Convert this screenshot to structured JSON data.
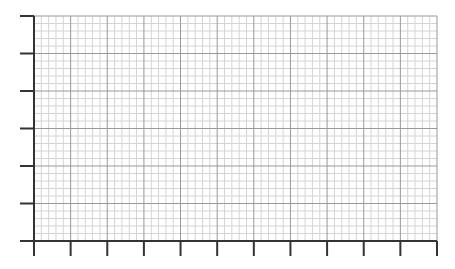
{
  "chart_data": {
    "type": "line",
    "title": "",
    "xlabel": "",
    "ylabel": "",
    "x_ticks": 12,
    "y_ticks": 7,
    "x_tick_labels": [],
    "y_tick_labels": [],
    "minor_subdivisions": 5,
    "grid": true,
    "series": [],
    "legend": null
  },
  "layout": {
    "plot_left": 34,
    "plot_right": 437,
    "plot_top": 16,
    "plot_bottom": 241,
    "x_intervals": 11,
    "y_intervals": 6,
    "minor_per_interval": 5,
    "y_tick_length": 14,
    "x_tick_length": 15
  },
  "colors": {
    "background": "#ffffff",
    "axis": "#333333",
    "major_grid": "#999999",
    "minor_grid": "#d4d4d4"
  }
}
